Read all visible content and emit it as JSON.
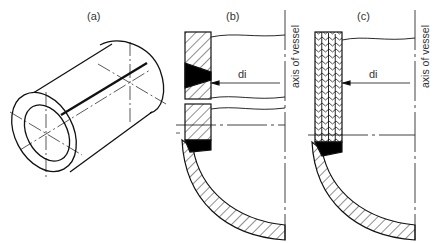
{
  "figure": {
    "panels": [
      {
        "id": "a",
        "label": "(a)",
        "description": "isometric view of cylindrical shell with longitudinal weld seam"
      },
      {
        "id": "b",
        "label": "(b)",
        "description": "section of solid-wall vessel with welded head",
        "dimension_label": "di",
        "axis_label": "axis of vessel"
      },
      {
        "id": "c",
        "label": "(c)",
        "description": "section of multilayer-wall vessel with welded head",
        "dimension_label": "di",
        "axis_label": "axis of vessel"
      }
    ]
  }
}
